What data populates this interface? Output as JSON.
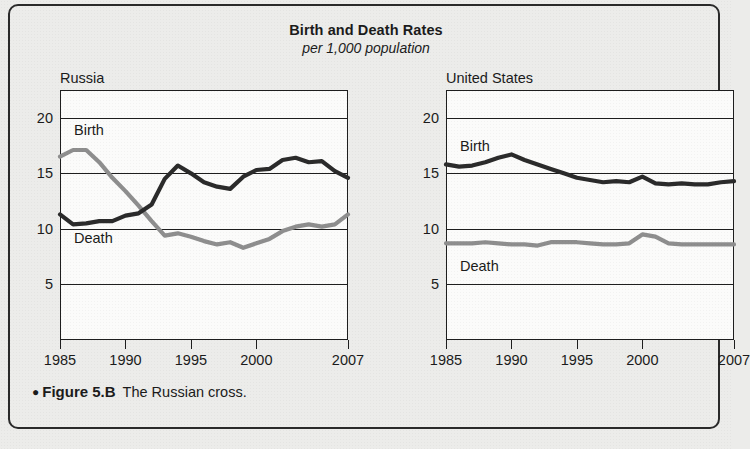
{
  "chart_data": {
    "type": "line",
    "title": "Birth and Death Rates",
    "subtitle": "per 1,000 population",
    "xlabel": "",
    "ylabel": "",
    "ylim": [
      0,
      22.5
    ],
    "xlim": [
      1985,
      2007
    ],
    "grid": true,
    "legend_position": "inline-labels",
    "yticks": [
      20,
      15,
      10,
      5
    ],
    "xticks": [
      1985,
      1990,
      1995,
      2000,
      2007
    ],
    "panels": [
      {
        "name": "Russia",
        "series": [
          {
            "name": "Birth",
            "color": "#8e8e8e",
            "x": [
              1985,
              1986,
              1987,
              1988,
              1989,
              1990,
              1991,
              1992,
              1993,
              1994,
              1995,
              1996,
              1997,
              1998,
              1999,
              2000,
              2001,
              2002,
              2003,
              2004,
              2005,
              2006,
              2007
            ],
            "values": [
              16.5,
              17.1,
              17.1,
              16.0,
              14.6,
              13.4,
              12.1,
              10.7,
              9.4,
              9.6,
              9.3,
              8.9,
              8.6,
              8.8,
              8.3,
              8.7,
              9.1,
              9.8,
              10.2,
              10.4,
              10.2,
              10.4,
              11.3
            ]
          },
          {
            "name": "Death",
            "color": "#2b2b2b",
            "x": [
              1985,
              1986,
              1987,
              1988,
              1989,
              1990,
              1991,
              1992,
              1993,
              1994,
              1995,
              1996,
              1997,
              1998,
              1999,
              2000,
              2001,
              2002,
              2003,
              2004,
              2005,
              2006,
              2007
            ],
            "values": [
              11.3,
              10.4,
              10.5,
              10.7,
              10.7,
              11.2,
              11.4,
              12.2,
              14.5,
              15.7,
              15.0,
              14.2,
              13.8,
              13.6,
              14.7,
              15.3,
              15.4,
              16.2,
              16.4,
              16.0,
              16.1,
              15.2,
              14.6
            ]
          }
        ]
      },
      {
        "name": "United States",
        "series": [
          {
            "name": "Birth",
            "color": "#2b2b2b",
            "x": [
              1985,
              1986,
              1987,
              1988,
              1989,
              1990,
              1991,
              1992,
              1993,
              1994,
              1995,
              1996,
              1997,
              1998,
              1999,
              2000,
              2001,
              2002,
              2003,
              2004,
              2005,
              2006,
              2007
            ],
            "values": [
              15.8,
              15.6,
              15.7,
              16.0,
              16.4,
              16.7,
              16.2,
              15.8,
              15.4,
              15.0,
              14.6,
              14.4,
              14.2,
              14.3,
              14.2,
              14.7,
              14.1,
              14.0,
              14.1,
              14.0,
              14.0,
              14.2,
              14.3
            ]
          },
          {
            "name": "Death",
            "color": "#8e8e8e",
            "x": [
              1985,
              1986,
              1987,
              1988,
              1989,
              1990,
              1991,
              1992,
              1993,
              1994,
              1995,
              1996,
              1997,
              1998,
              1999,
              2000,
              2001,
              2002,
              2003,
              2004,
              2005,
              2006,
              2007
            ],
            "values": [
              8.7,
              8.7,
              8.7,
              8.8,
              8.7,
              8.6,
              8.6,
              8.5,
              8.8,
              8.8,
              8.8,
              8.7,
              8.6,
              8.6,
              8.7,
              9.5,
              9.3,
              8.7,
              8.6,
              8.6,
              8.6,
              8.6,
              8.6
            ]
          }
        ]
      }
    ]
  },
  "caption": {
    "bullet": "●",
    "figure_number": "Figure 5.B",
    "text": "The Russian cross."
  }
}
